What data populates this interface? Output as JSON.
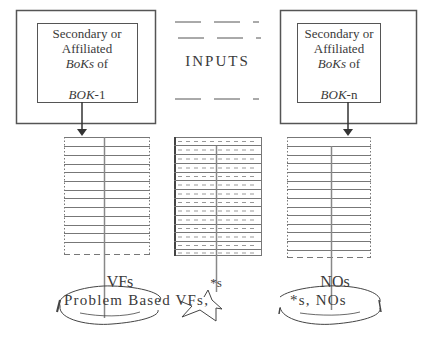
{
  "left_box": {
    "line1": "Secondary or",
    "line2": "Affiliated",
    "line3_italic": "BoKs",
    "line3_rest": " of",
    "line4_italic": "BOK",
    "line4_rest": "-1"
  },
  "right_box": {
    "line1": "Secondary or",
    "line2": "Affiliated",
    "line3_italic": "BoKs",
    "line3_rest": " of",
    "line4_italic": "BOK",
    "line4_rest": "-n"
  },
  "center": {
    "inputs_label": "INPUTS"
  },
  "outputs": {
    "left_label": "VFs",
    "middle_label": "*s",
    "right_label": "NOs",
    "bottom_text_left": "Problem Based VFs,",
    "bottom_text_right": "*s, NOs"
  },
  "colors": {
    "stroke": "#555555",
    "text": "#3a3a3a",
    "background": "#ffffff"
  }
}
